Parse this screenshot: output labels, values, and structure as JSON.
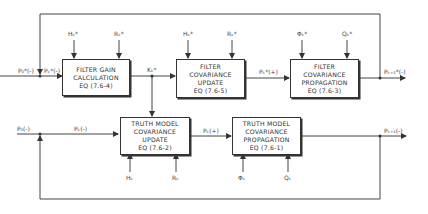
{
  "diagram": {
    "filter_gain": {
      "line1": "FILTER GAIN",
      "line2": "CALCULATION",
      "eq": "EQ (7.6-4)"
    },
    "filter_update": {
      "line1": "FILTER",
      "line2": "COVARIANCE",
      "line3": "UPDATE",
      "eq": "EQ (7.6-5)"
    },
    "filter_prop": {
      "line1": "FILTER",
      "line2": "COVARIANCE",
      "line3": "PROPAGATION",
      "eq": "EQ (7.6-3)"
    },
    "truth_update": {
      "line1": "TRUTH MODEL",
      "line2": "COVARIANCE",
      "line3": "UPDATE",
      "eq": "EQ (7.6-2)"
    },
    "truth_prop": {
      "line1": "TRUTH MODEL",
      "line2": "COVARIANCE",
      "line3": "PROPAGATION",
      "eq": "EQ (7.6-1)"
    },
    "labels": {
      "p0_star": "P₀*(-)",
      "pk_star_minus": "Pₖ*(-)",
      "h_star_1": "Hₖ*",
      "r_star_1": "Rₖ*",
      "k_star": "Kₖ*",
      "h_star_2": "Hₖ*",
      "r_star_2": "Rₖ*",
      "pk_star_plus": "Pₖ*(+)",
      "phi_star": "Φₖ*",
      "q_star": "Qₖ*",
      "pk1_star_minus": "Pₖ₊₁*(-)",
      "p0": "P₀(-)",
      "pk_minus": "Pₖ(-)",
      "pk_plus": "Pₖ(+)",
      "pk1_minus": "Pₖ₊₁(-)",
      "hk": "Hₖ",
      "rk": "Rₖ",
      "phik": "Φₖ",
      "qk": "Qₖ"
    }
  }
}
